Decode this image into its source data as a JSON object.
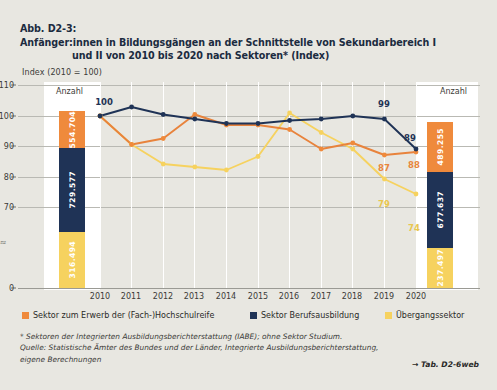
{
  "figure": {
    "number": "Abb. D2-3:",
    "title_line1": "Anfänger:innen in Bildungsgängen an der Schnittstelle von Sekundarbereich I",
    "title_line2": "und II von 2010 bis 2020 nach Sektoren* (Index)"
  },
  "axis_caption": "Index (2010 = 100)",
  "anzahl_label_left": "Anzahl",
  "anzahl_label_right": "Anzahl",
  "bars": {
    "left": {
      "year": "2010",
      "orange": "554.704",
      "navy": "729.577",
      "yellow": "316.494"
    },
    "right": {
      "year": "2020",
      "orange": "489.255",
      "navy": "677.637",
      "yellow": "237.497"
    }
  },
  "legend": [
    {
      "swatch": "orange",
      "label": "Sektor zum Erwerb der (Fach-)Hochschulreife"
    },
    {
      "swatch": "navy",
      "label": "Sektor Berufsausbildung"
    },
    {
      "swatch": "yellow",
      "label": "Übergangssektor"
    }
  ],
  "footnotes": {
    "star": "*  Sektoren der Integrierten Ausbildungsberichterstattung (IABE); ohne Sektor Studium.",
    "source_line1": "Quelle: Statistische Ämter des Bundes und der Länder, Integrierte Ausbildungsberichterstattung,",
    "source_line2": "eigene Berechnungen",
    "table_ref": "→ Tab. D2-6web"
  },
  "axis_break_symbol": "≈",
  "colors": {
    "orange": "#ef8a3c",
    "navy": "#1f3356",
    "yellow": "#f6d25f",
    "background": "#e8e7e1",
    "panel": "#ffffff",
    "grid": "#b9b9b3"
  },
  "chart_data": {
    "type": "line",
    "title": "Abb. D2-3: Anfänger:innen in Bildungsgängen an der Schnittstelle von Sekundarbereich I und II von 2010 bis 2020 nach Sektoren* (Index)",
    "xlabel": "",
    "ylabel": "Index (2010 = 100)",
    "ylim": [
      0,
      110
    ],
    "yticks": [
      0,
      70,
      80,
      90,
      100,
      110
    ],
    "y_axis_break": true,
    "grid": true,
    "legend_position": "bottom",
    "categories": [
      "2010",
      "2011",
      "2012",
      "2013",
      "2014",
      "2015",
      "2016",
      "2017",
      "2018",
      "2019",
      "2020"
    ],
    "series": [
      {
        "name": "Sektor Berufsausbildung",
        "color": "#1f3356",
        "values": [
          100,
          103,
          100.5,
          99,
          97.5,
          97.5,
          98.5,
          99,
          100,
          99,
          89
        ],
        "labels": {
          "2010": "100",
          "2019": "99",
          "2020": "89"
        }
      },
      {
        "name": "Sektor zum Erwerb der (Fach-)Hochschulreife",
        "color": "#ef8a3c",
        "values": [
          100,
          90.5,
          92.5,
          100.5,
          97,
          97,
          95.5,
          89,
          91,
          87,
          88
        ],
        "labels": {
          "2019": "87",
          "2020": "88"
        }
      },
      {
        "name": "Übergangssektor",
        "color": "#f6d25f",
        "values": [
          100,
          90.5,
          84,
          83,
          82,
          86.5,
          101,
          94.5,
          89,
          79,
          74
        ],
        "labels": {
          "2019": "79",
          "2020": "74"
        }
      }
    ],
    "annotations": [
      {
        "text": "Anzahl",
        "position": "left-bar-top"
      },
      {
        "text": "Anzahl",
        "position": "right-bar-top"
      }
    ],
    "stacked_bars": [
      {
        "year": "2010",
        "segments": [
          {
            "name": "Sektor zum Erwerb der (Fach-)Hochschulreife",
            "value": 554704,
            "label": "554.704"
          },
          {
            "name": "Sektor Berufsausbildung",
            "value": 729577,
            "label": "729.577"
          },
          {
            "name": "Übergangssektor",
            "value": 316494,
            "label": "316.494"
          }
        ]
      },
      {
        "year": "2020",
        "segments": [
          {
            "name": "Sektor zum Erwerb der (Fach-)Hochschulreife",
            "value": 489255,
            "label": "489.255"
          },
          {
            "name": "Sektor Berufsausbildung",
            "value": 677637,
            "label": "677.637"
          },
          {
            "name": "Übergangssektor",
            "value": 237497,
            "label": "237.497"
          }
        ]
      }
    ]
  }
}
